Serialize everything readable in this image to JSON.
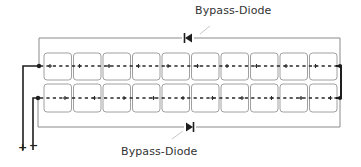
{
  "diagram": {
    "type": "solar-module-string-wiring",
    "labels": {
      "top_diode": "Bypass-Diode",
      "bottom_diode": "Bypass-Diode"
    },
    "terminals": {
      "positive": "+",
      "negative": "−"
    },
    "rows": [
      {
        "name": "top-string",
        "cells": 10,
        "polarity_per_cell": [
          "+",
          "−"
        ]
      },
      {
        "name": "bottom-string",
        "cells": 10,
        "polarity_per_cell": [
          "−",
          "+"
        ]
      }
    ],
    "diodes": [
      {
        "name": "top-bypass-diode",
        "direction": "left"
      },
      {
        "name": "bottom-bypass-diode",
        "direction": "right"
      }
    ],
    "colors": {
      "wire": "#2a2a2a",
      "frame": "#8a8a8a",
      "cell_border": "#9a9a9a",
      "text": "#333333"
    }
  }
}
